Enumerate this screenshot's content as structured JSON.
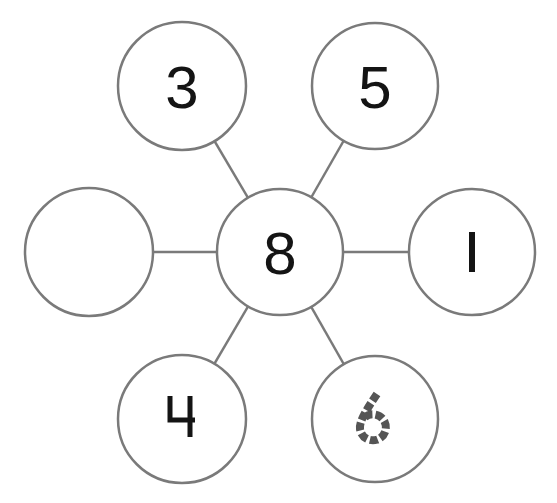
{
  "diagram": {
    "type": "number-bond-web",
    "colors": {
      "stroke": "#7a7a7a",
      "digit": "#141414",
      "traced_digit": "#555555",
      "fill": "#ffffff"
    },
    "center": {
      "id": "center",
      "value": "8",
      "cx": 280,
      "cy": 252,
      "r": 63
    },
    "nodes": [
      {
        "id": "top-left",
        "value": "3",
        "cx": 182,
        "cy": 86,
        "r": 64,
        "style": "solid"
      },
      {
        "id": "top-right",
        "value": "5",
        "cx": 375,
        "cy": 86,
        "r": 63,
        "style": "solid"
      },
      {
        "id": "left",
        "value": "",
        "cx": 89,
        "cy": 252,
        "r": 64,
        "style": "empty"
      },
      {
        "id": "right",
        "value": "1",
        "cx": 472,
        "cy": 252,
        "r": 63,
        "style": "stroke-one"
      },
      {
        "id": "bottom-left",
        "value": "4",
        "cx": 182,
        "cy": 419,
        "r": 64,
        "style": "open-four"
      },
      {
        "id": "bottom-right",
        "value": "6",
        "cx": 375,
        "cy": 419,
        "r": 63,
        "style": "dashed-trace"
      }
    ]
  }
}
